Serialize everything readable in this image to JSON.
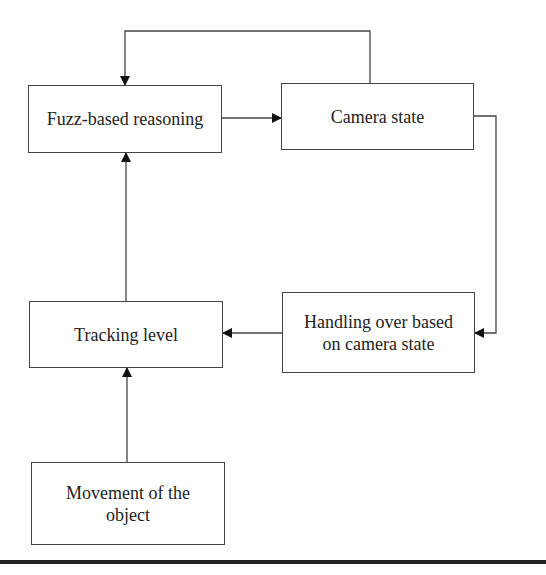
{
  "diagram": {
    "nodes": {
      "fuzz": {
        "label": "Fuzz-based reasoning"
      },
      "camera": {
        "label": "Camera state"
      },
      "tracking": {
        "label": "Tracking level"
      },
      "handling": {
        "label": "Handling over based on camera state"
      },
      "movement": {
        "label": "Movement of the object"
      }
    },
    "edges": [
      {
        "from": "fuzz",
        "to": "camera"
      },
      {
        "from": "camera",
        "to": "fuzz"
      },
      {
        "from": "camera",
        "to": "handling"
      },
      {
        "from": "handling",
        "to": "tracking"
      },
      {
        "from": "tracking",
        "to": "fuzz"
      },
      {
        "from": "movement",
        "to": "tracking"
      }
    ]
  }
}
